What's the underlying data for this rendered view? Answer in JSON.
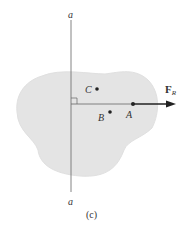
{
  "diagram": {
    "caption": "(c)",
    "axis": {
      "top_label": "a",
      "bottom_label": "a"
    },
    "points": [
      {
        "id": "C",
        "label": "C"
      },
      {
        "id": "B",
        "label": "B"
      },
      {
        "id": "A",
        "label": "A"
      }
    ],
    "force": {
      "symbol": "F",
      "subscript": "R"
    },
    "colors": {
      "body_fill": "#e4e4e4",
      "line": "#555555",
      "arrow": "#222222"
    }
  }
}
